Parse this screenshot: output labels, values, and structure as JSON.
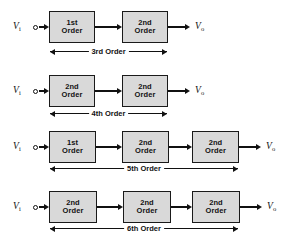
{
  "diagram": {
    "colors": {
      "background": "#ffffff",
      "block_fill": "#d9d9d9",
      "block_border": "#1a1a1a",
      "line": "#111111"
    },
    "input_label": {
      "base": "V",
      "sub": "i"
    },
    "output_label": {
      "base": "V",
      "sub": "o"
    },
    "rows": [
      {
        "id": "row-3rd-order",
        "span_label": "3rd Order",
        "blocks": [
          {
            "line1": "1st",
            "line2": "Order"
          },
          {
            "line1": "2nd",
            "line2": "Order"
          }
        ]
      },
      {
        "id": "row-4th-order",
        "span_label": "4th Order",
        "blocks": [
          {
            "line1": "2nd",
            "line2": "Order"
          },
          {
            "line1": "2nd",
            "line2": "Order"
          }
        ]
      },
      {
        "id": "row-5th-order",
        "span_label": "5th Order",
        "blocks": [
          {
            "line1": "1st",
            "line2": "Order"
          },
          {
            "line1": "2nd",
            "line2": "Order"
          },
          {
            "line1": "2nd",
            "line2": "Order"
          }
        ]
      },
      {
        "id": "row-6th-order",
        "span_label": "6th Order",
        "blocks": [
          {
            "line1": "2nd",
            "line2": "Order"
          },
          {
            "line1": "2nd",
            "line2": "Order"
          },
          {
            "line1": "2nd",
            "line2": "Order"
          }
        ]
      }
    ]
  },
  "layout": {
    "rows": [
      {
        "top": 0,
        "block_y": 11,
        "block_h": 32,
        "axis_y": 27,
        "dim_y": 51,
        "blocks_x": [
          49,
          122
        ],
        "block_w": 46,
        "dim_from": 50,
        "dim_to": 167
      },
      {
        "top": 64,
        "block_y": 75,
        "block_h": 32,
        "axis_y": 91,
        "dim_y": 113,
        "blocks_x": [
          49,
          122
        ],
        "block_w": 46,
        "dim_from": 50,
        "dim_to": 167
      },
      {
        "top": 120,
        "block_y": 131,
        "block_h": 32,
        "axis_y": 147,
        "dim_y": 168,
        "blocks_x": [
          49,
          122,
          192
        ],
        "block_w": 47,
        "dim_from": 50,
        "dim_to": 238
      },
      {
        "top": 180,
        "block_y": 191,
        "block_h": 32,
        "axis_y": 207,
        "dim_y": 228,
        "blocks_x": [
          49,
          123,
          192
        ],
        "block_w": 48,
        "dim_from": 50,
        "dim_to": 238
      }
    ],
    "terminal_dot_x": 33,
    "in_label_x": 13,
    "out_arrow_gap": 22,
    "out_label_gap": 27
  }
}
